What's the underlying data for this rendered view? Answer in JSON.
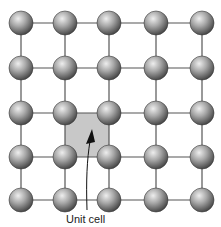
{
  "diagram": {
    "type": "square-lattice",
    "rows": 5,
    "cols": 5,
    "x_positions": [
      21,
      65,
      109,
      156,
      202
    ],
    "y_positions": [
      23,
      68,
      113,
      157,
      200
    ],
    "atom_radius": 12,
    "unit_cell": {
      "label": "Unit cell",
      "corner_row": 2,
      "corner_col": 1,
      "fill": "#c8c8c8"
    },
    "colors": {
      "bond": "#555555",
      "atom_light": "#e6e6e6",
      "atom_mid": "#9a9a9a",
      "atom_dark": "#4a4a4a",
      "arrow": "#111111"
    }
  }
}
